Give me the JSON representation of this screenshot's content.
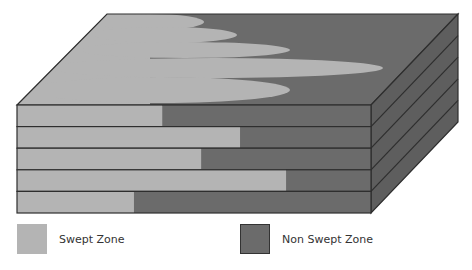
{
  "diagram": {
    "colors": {
      "swept": "#b4b4b4",
      "non_swept": "#6b6b6b",
      "side_face": "#5e5e5e",
      "outline": "#2e2e2e"
    },
    "layers": [
      {
        "index": 1,
        "swept_fraction": 0.41
      },
      {
        "index": 2,
        "swept_fraction": 0.63
      },
      {
        "index": 3,
        "swept_fraction": 0.52
      },
      {
        "index": 4,
        "swept_fraction": 0.76
      },
      {
        "index": 5,
        "swept_fraction": 0.33
      }
    ]
  },
  "legend": {
    "items": [
      {
        "label": "Swept Zone",
        "color": "#b4b4b4"
      },
      {
        "label": "Non Swept Zone",
        "color": "#6b6b6b"
      }
    ]
  }
}
